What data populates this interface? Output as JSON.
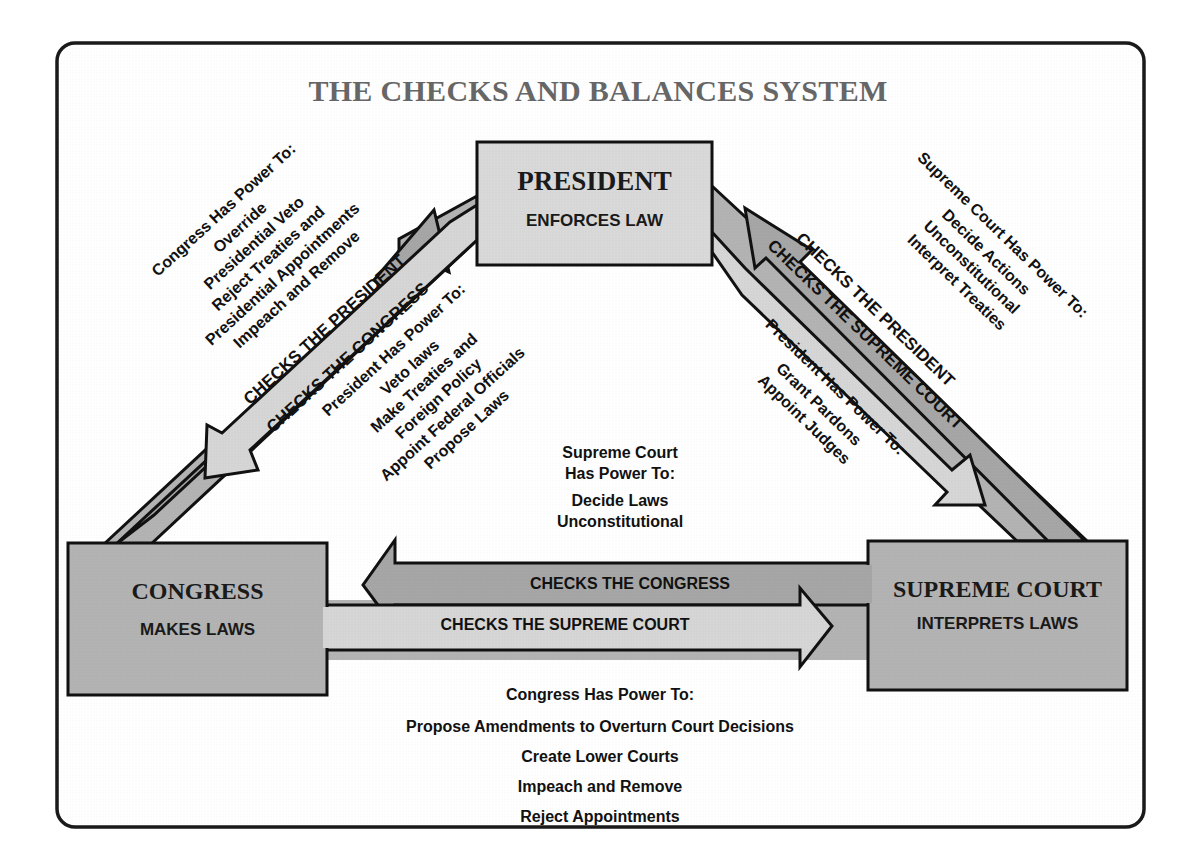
{
  "title": "THE CHECKS AND BALANCES SYSTEM",
  "colors": {
    "frame": "#1a1a1a",
    "box_president": "#d9d9d9",
    "box_branch": "#b3b3b3",
    "arrow_dark": "#a6a6a6",
    "arrow_light": "#d6d6d6",
    "title_text": "#666666"
  },
  "branches": {
    "president": {
      "name": "PRESIDENT",
      "role": "ENFORCES LAW"
    },
    "congress": {
      "name": "CONGRESS",
      "role": "MAKES LAWS"
    },
    "supreme_court": {
      "name": "SUPREME COURT",
      "role": "INTERPRETS LAWS"
    }
  },
  "arrows": {
    "congress_checks_president": "CHECKS THE PRESIDENT",
    "president_checks_congress": "CHECKS THE CONGRESS",
    "court_checks_president": "CHECKS THE PRESIDENT",
    "president_checks_court": "CHECKS THE SUPREME COURT",
    "court_checks_congress": "CHECKS THE CONGRESS",
    "congress_checks_court": "CHECKS THE SUPREME COURT"
  },
  "powers": {
    "congress_over_president": {
      "heading": "Congress Has Power To:",
      "items": [
        "Override",
        "Presidential Veto",
        "Reject Treaties and",
        "Presidential Appointments",
        "Impeach and Remove"
      ]
    },
    "president_over_congress": {
      "heading": "President Has Power To:",
      "items": [
        "Veto laws",
        "Make Treaties and",
        "Foreign Policy",
        "Appoint Federal Officials",
        "Propose Laws"
      ]
    },
    "court_over_president": {
      "heading": "Supreme Court Has Power To:",
      "items": [
        "Decide Actions",
        "Unconstitutional",
        "Interpret Treaties"
      ]
    },
    "president_over_court": {
      "heading": "President Has Power To:",
      "items": [
        "Grant Pardons",
        "Appoint Judges"
      ]
    },
    "court_over_congress": {
      "heading_line1": "Supreme Court",
      "heading_line2": "Has Power To:",
      "items": [
        "Decide Laws",
        "Unconstitutional"
      ]
    },
    "congress_over_court": {
      "heading": "Congress Has Power To:",
      "items": [
        "Propose Amendments to Overturn Court Decisions",
        "Create Lower Courts",
        "Impeach and Remove",
        "Reject Appointments"
      ]
    }
  }
}
